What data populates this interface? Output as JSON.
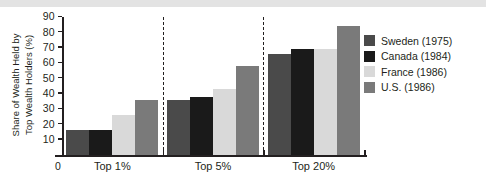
{
  "chart_data": {
    "type": "bar",
    "title": "",
    "subtitle": "",
    "xlabel": "",
    "ylabel": "Share of Wealth Held by Top Wealth Holders (%)",
    "ylabel_lines": [
      "Share of Wealth Held by",
      "Top Wealth Holders (%)"
    ],
    "categories": [
      "Top 1%",
      "Top 5%",
      "Top 20%"
    ],
    "ylim": [
      0,
      90
    ],
    "ytick_labels": [
      "0",
      "10",
      "20",
      "30",
      "40",
      "50",
      "60",
      "70",
      "80",
      "90"
    ],
    "ytick_values": [
      0,
      10,
      20,
      30,
      40,
      50,
      60,
      70,
      80,
      90
    ],
    "origin_label": "0",
    "grid": false,
    "legend_position": "right",
    "group_separators": true,
    "series": [
      {
        "name": "Sweden (1975)",
        "color": "#4a4a4a",
        "values": [
          16,
          36,
          66
        ]
      },
      {
        "name": "Canada (1984)",
        "color": "#1a1a1a",
        "values": [
          16.5,
          38,
          69
        ]
      },
      {
        "name": "France (1986)",
        "color": "#d9d9d9",
        "values": [
          26,
          43,
          69
        ]
      },
      {
        "name": "U.S. (1986)",
        "color": "#7a7a7a",
        "values": [
          36,
          58,
          84
        ]
      }
    ]
  }
}
